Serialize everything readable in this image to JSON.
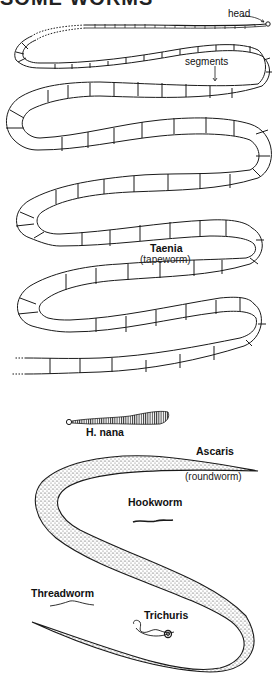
{
  "title": "SOME WORMS",
  "tapeworm": {
    "name": "Taenia",
    "common_name": "(tapeworm)",
    "annotations": {
      "head": "head",
      "segments": "segments"
    }
  },
  "dwarf_tapeworm": {
    "name": "H. nana"
  },
  "roundworm": {
    "name": "Ascaris",
    "common_name": "(roundworm)"
  },
  "hookworm": {
    "name": "Hookworm"
  },
  "threadworm": {
    "name": "Threadworm"
  },
  "whipworm": {
    "name": "Trichuris"
  },
  "colors": {
    "ink": "#1a1a1a",
    "background": "#ffffff"
  }
}
